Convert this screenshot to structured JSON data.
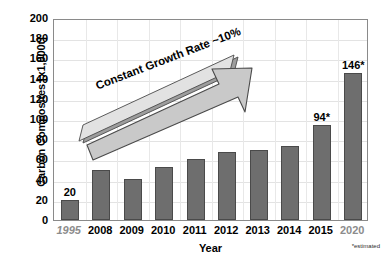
{
  "chart_data": {
    "type": "bar",
    "title": "",
    "xlabel": "Year",
    "ylabel": "Carbon Composites [x1,000t]",
    "ylim": [
      0,
      200
    ],
    "ytick_step": 20,
    "yticks": [
      "200",
      "180",
      "160",
      "140",
      "120",
      "100",
      "80",
      "60",
      "40",
      "20",
      "0"
    ],
    "grid": true,
    "legend": "none",
    "categories": [
      "1995",
      "2008",
      "2009",
      "2010",
      "2011",
      "2012",
      "2013",
      "2014",
      "2015",
      "2020"
    ],
    "values": [
      20,
      50,
      41,
      52,
      60,
      67,
      69,
      73,
      94,
      146
    ],
    "point_labels": [
      "20",
      "",
      "",
      "",
      "",
      "",
      "",
      "",
      "94*",
      "146*"
    ],
    "category_styles": [
      "italic-muted",
      "normal",
      "normal",
      "normal",
      "normal",
      "normal",
      "normal",
      "normal",
      "normal",
      "muted"
    ],
    "annotations": [
      {
        "name": "growth-arrow",
        "text": "Constant Growth Rate ~10%"
      }
    ],
    "footnote": "*estimated",
    "colors": {
      "bar_fill": "#6e6e6e",
      "bar_stroke": "#4a4a4a",
      "grid": "#e3e3e3",
      "frame": "#8a8a8a",
      "arrow_fill": "#c9c9c9",
      "arrow_stroke": "#5a5a5a",
      "text": "#000000",
      "muted_text": "#8c8c8c",
      "background": "#ffffff"
    }
  }
}
